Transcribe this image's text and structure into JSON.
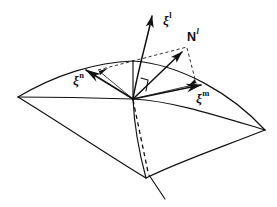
{
  "figure": {
    "kind": "differential-geometry-surface-diagram",
    "background_color": "#ffffff",
    "stroke_color": "#111111",
    "canvas": {
      "width": 277,
      "height": 207
    },
    "labels": {
      "tangent_n": {
        "base": "ξ",
        "sup": "n"
      },
      "tangent_m": {
        "base": "ξ",
        "sup": "m"
      },
      "vector_l": {
        "base": "ξ",
        "sup": "l"
      },
      "normal_l": {
        "base": "N",
        "sup": "l"
      }
    },
    "geometry": {
      "origin": {
        "x": 133,
        "y": 99
      },
      "surface_corners": {
        "left": {
          "x": 18,
          "y": 97
        },
        "top": {
          "x": 133,
          "y": 61
        },
        "right": {
          "x": 265,
          "y": 130
        },
        "bottom": {
          "x": 146,
          "y": 178
        }
      },
      "arrow_tips": {
        "tangent_n": {
          "x": 80,
          "y": 69
        },
        "tangent_m": {
          "x": 208,
          "y": 85
        },
        "vector_l": {
          "x": 152,
          "y": 12
        },
        "normal_l": {
          "x": 185,
          "y": 48
        }
      },
      "dashed_descender_end": {
        "x": 148,
        "y": 172
      },
      "solid_descender_end": {
        "x": 165,
        "y": 199
      }
    }
  }
}
